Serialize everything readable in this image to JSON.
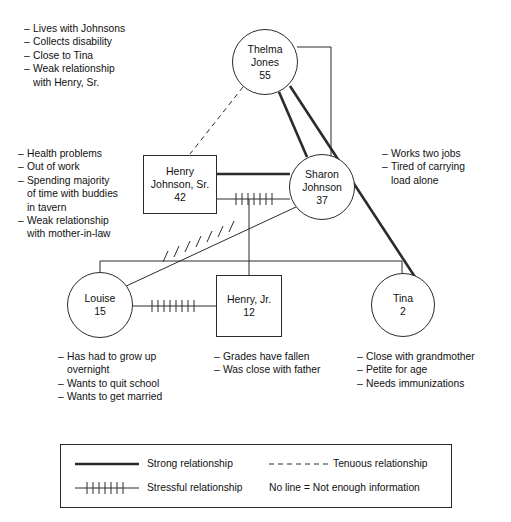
{
  "diagram": {
    "stroke_color": "#2b2b2b",
    "background": "#ffffff"
  },
  "nodes": [
    {
      "id": "thelma",
      "shape": "circle",
      "name_lines": [
        "Thelma",
        "Jones"
      ],
      "age": "55",
      "cx": 265,
      "cy": 62,
      "r": 33
    },
    {
      "id": "henry_sr",
      "shape": "square",
      "name_lines": [
        "Henry",
        "Johnson, Sr."
      ],
      "age": "42",
      "x": 143,
      "y": 155,
      "w": 74,
      "h": 59
    },
    {
      "id": "sharon",
      "shape": "circle",
      "name_lines": [
        "Sharon",
        "Johnson"
      ],
      "age": "37",
      "cx": 322,
      "cy": 187,
      "r": 33
    },
    {
      "id": "louise",
      "shape": "circle",
      "name_lines": [
        "Louise"
      ],
      "age": "15",
      "cx": 100,
      "cy": 305,
      "r": 33
    },
    {
      "id": "henry_jr",
      "shape": "square",
      "name_lines": [
        "Henry, Jr."
      ],
      "age": "12",
      "x": 216,
      "y": 275,
      "w": 66,
      "h": 62
    },
    {
      "id": "tina",
      "shape": "circle",
      "name_lines": [
        "Tina"
      ],
      "age": "2",
      "cx": 403,
      "cy": 305,
      "r": 32
    }
  ],
  "notes": {
    "thelma": {
      "x": 24,
      "y": 22,
      "align": "left",
      "items": [
        "Lives with Johnsons",
        "Collects disability",
        "Close to Tina",
        "Weak relationship\nwith Henry, Sr."
      ]
    },
    "henry_sr": {
      "x": 18,
      "y": 147,
      "align": "left",
      "items": [
        "Health problems",
        "Out of work",
        "Spending majority\nof time with buddies\nin tavern",
        "Weak relationship\nwith mother-in-law"
      ]
    },
    "sharon": {
      "x": 382,
      "y": 147,
      "align": "left",
      "items": [
        "Works two jobs",
        "Tired of carrying\nload alone"
      ]
    },
    "louise": {
      "x": 58,
      "y": 350,
      "align": "left",
      "items": [
        "Has had to grow up\novernight",
        "Wants to quit school",
        "Wants to get married"
      ]
    },
    "henry_jr": {
      "x": 214,
      "y": 350,
      "align": "left",
      "items": [
        "Grades have fallen",
        "Was close with father"
      ]
    },
    "tina": {
      "x": 357,
      "y": 350,
      "align": "left",
      "items": [
        "Close with grandmother",
        "Petite for age",
        "Needs immunizations"
      ]
    }
  },
  "legend": {
    "box": {
      "x": 60,
      "y": 444,
      "w": 392,
      "h": 64
    },
    "entries": [
      {
        "id": "strong",
        "style": "strong",
        "label": "Strong relationship"
      },
      {
        "id": "tenuous",
        "style": "tenuous",
        "label": "Tenuous relationship"
      },
      {
        "id": "stressful",
        "style": "stressful",
        "label": "Stressful relationship"
      },
      {
        "id": "none",
        "style": "none",
        "label": "No line = Not enough information"
      }
    ]
  },
  "relationships": [
    {
      "from": "thelma",
      "to": "henry_sr",
      "style": "tenuous"
    },
    {
      "from": "thelma",
      "to": "sharon",
      "style": "strong"
    },
    {
      "from": "thelma",
      "to": "tina",
      "style": "strong"
    },
    {
      "from": "thelma",
      "to": "sharon",
      "style": "plain-elbow"
    },
    {
      "from": "henry_sr",
      "to": "sharon",
      "style": "strong"
    },
    {
      "from": "henry_sr",
      "to": "sharon",
      "style": "stressful"
    },
    {
      "from": "sharon",
      "to": "louise",
      "style": "stressful"
    },
    {
      "from": "louise",
      "to": "henry_jr",
      "style": "stressful"
    }
  ]
}
